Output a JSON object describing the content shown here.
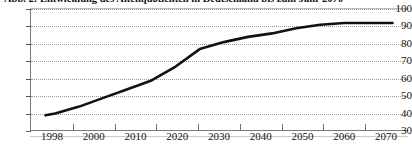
{
  "chart_data": {
    "type": "line",
    "title": "Abb. 2: Entwicklung des Altenquotienten in Deutschland bis zum Jahr 2070",
    "xlabel": "",
    "ylabel": "",
    "xlim": [
      1995,
      2073
    ],
    "ylim": [
      30,
      100
    ],
    "grid": true,
    "legend": "none",
    "series_color": "#111111",
    "gridline_color": "#9a9a9a",
    "axis_color": "#7a7a7a",
    "y_ticks": [
      100,
      90,
      80,
      70,
      60,
      50,
      40,
      30
    ],
    "x_ticks": [
      "1998",
      "2000",
      "2010",
      "2020",
      "2030",
      "2040",
      "2050",
      "2060",
      "2070"
    ],
    "x": [
      1998,
      2000,
      2005,
      2010,
      2015,
      2020,
      2025,
      2030,
      2035,
      2040,
      2045,
      2050,
      2055,
      2060,
      2065,
      2070
    ],
    "values": [
      39,
      40,
      44,
      49,
      54,
      59,
      67,
      77,
      81,
      84,
      86,
      89,
      91,
      92,
      92,
      92
    ],
    "series": [
      {
        "name": "Altenquotient",
        "values": [
          39,
          40,
          44,
          49,
          54,
          59,
          67,
          77,
          81,
          84,
          86,
          89,
          91,
          92,
          92,
          92
        ]
      }
    ]
  }
}
